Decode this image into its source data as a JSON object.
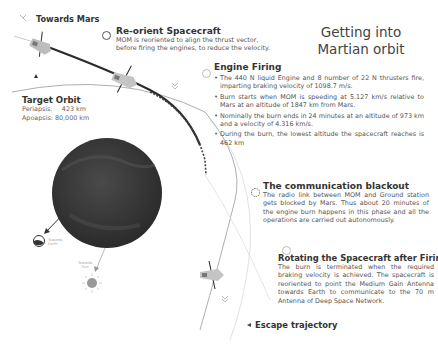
{
  "title": {
    "line1": "Getting into",
    "line2": "Martian orbit"
  },
  "towards_mars": {
    "label": "Towards Mars"
  },
  "reorient": {
    "heading": "Re-orient Spacecraft",
    "body": "MOM is reoriented to align the thrust vector, before firing the engines, to reduce the velocity."
  },
  "engine_firing": {
    "heading": "Engine Firing",
    "bullets": [
      "The 440 N liquid Engine and 8 number of 22 N thrusters fire, imparting braking velocity of 1098.7 m/s.",
      "Burn starts when MOM is speeding at 5.127 km/s relative to Mars at an altitude of 1847 km from Mars.",
      "Nominally the burn ends in 24 minutes at an altitude of 973 km and a velocity of 4.316 km/s.",
      "During the burn, the lowest altitude the spacecraft reaches is 462 km"
    ]
  },
  "blackout": {
    "heading": "The communication blackout",
    "body": "The radio link between MOM and Ground station gets blocked by Mars. Thus about 20 minutes of the engine burn happens in this phase and all the operations are carried out autonomously."
  },
  "rotating": {
    "heading": "Rotating the Spacecraft after Firing",
    "body": "The burn is terminated when the required braking velocity is achieved. The spacecraft is reoriented to point the Medium Gain Antenna towards Earth  to communicate to the 70 m Antenna of Deep Space Network."
  },
  "target_orbit": {
    "heading": "Target Orbit",
    "rows": [
      {
        "key": "Periapsis:",
        "value": "423 km"
      },
      {
        "key": "Apoapsis:",
        "value": "80,000 km"
      }
    ]
  },
  "escape": {
    "label": "Escape trajectory"
  },
  "earth": {
    "line1": "Towards",
    "line2": "Earth"
  },
  "sun": {
    "line1": "Towards",
    "line2": "Sun"
  },
  "colors": {
    "mars": "#3a3a3a",
    "trajectory": "#2a2a2a",
    "orbit": "#888888",
    "spacecraft": "#bdbdbd"
  }
}
